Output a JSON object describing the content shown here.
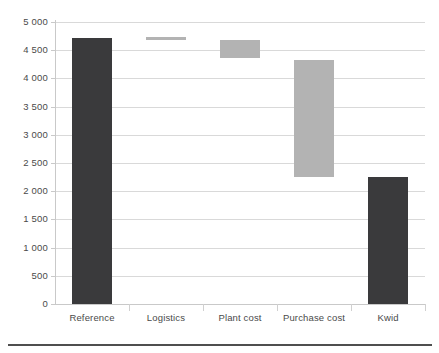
{
  "chart_data": {
    "type": "bar",
    "subtype": "waterfall",
    "title": "",
    "subtitle": "",
    "xlabel": "",
    "ylabel": "",
    "categories": [
      "Reference",
      "Logistics",
      "Plant cost",
      "Purchase cost",
      "Kwid"
    ],
    "ylim": [
      0,
      5000
    ],
    "yticks": [
      0,
      500,
      1000,
      1500,
      2000,
      2500,
      3000,
      3500,
      4000,
      4500,
      5000
    ],
    "ytick_labels": [
      "0",
      "500",
      "1 000",
      "1 500",
      "2 000",
      "2 500",
      "3 000",
      "3 500",
      "4 000",
      "4 500",
      "5 000"
    ],
    "grid": true,
    "legend": "none",
    "thousands_separator": "space",
    "colors": {
      "total_bar": "#3a3a3c",
      "step_bar": "#b3b3b3",
      "gridline": "#d9d9d9",
      "axis": "#c9c9c9",
      "text": "#4a4a4a",
      "background": "#ffffff",
      "bottom_rule": "#4f4f4f"
    },
    "bars": [
      {
        "category": "Reference",
        "kind": "total",
        "base": 0,
        "top": 4715,
        "value": 4715,
        "color": "#3a3a3c"
      },
      {
        "category": "Logistics",
        "kind": "step",
        "base": 4680,
        "top": 4735,
        "value": 55,
        "color": "#b3b3b3"
      },
      {
        "category": "Plant cost",
        "kind": "step",
        "base": 4360,
        "top": 4680,
        "value": -320,
        "color": "#b3b3b3"
      },
      {
        "category": "Purchase cost",
        "kind": "step",
        "base": 2250,
        "top": 4325,
        "value": -2075,
        "color": "#b3b3b3"
      },
      {
        "category": "Kwid",
        "kind": "total",
        "base": 0,
        "top": 2250,
        "value": 2250,
        "color": "#3a3a3c"
      }
    ],
    "annotations": []
  }
}
